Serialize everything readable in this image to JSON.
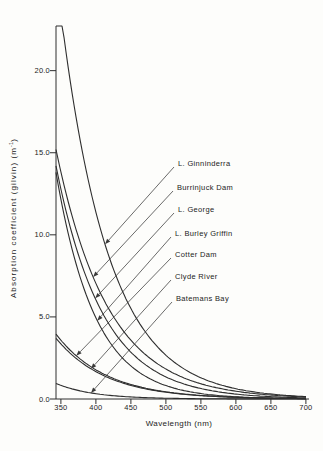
{
  "figure": {
    "x_axis_title": "Wavelength (nm)",
    "y_axis_title_prefix": "Absorption coefficient (gilvin)  (m",
    "y_axis_title_sup": "-1",
    "y_axis_title_suffix": ")"
  },
  "chart_data": {
    "type": "line",
    "title": "",
    "xlabel": "Wavelength (nm)",
    "ylabel": "Absorption coefficient (gilvin) (m^-1)",
    "grid": false,
    "legend_style": "leader-line annotations with arrowheads",
    "x_axis": {
      "min": 343,
      "max": 706,
      "ticks": [
        350,
        400,
        450,
        500,
        550,
        600,
        650,
        700
      ]
    },
    "y_axis": {
      "min": 0,
      "max": 22.72,
      "ticks": [
        0,
        5,
        10,
        15,
        20
      ],
      "tick_labels": [
        "0.0",
        "5.0",
        "10.0",
        "15.0",
        "20.0"
      ]
    },
    "x_sample_nm": [
      350,
      400,
      450,
      500,
      550,
      600,
      650,
      700
    ],
    "series": [
      {
        "name": "L. Ginninderra",
        "values": [
          23.5,
          11.4,
          5.5,
          2.7,
          1.3,
          0.62,
          0.3,
          0.15
        ],
        "model": {
          "a343": 26.0,
          "s_per_nm": 0.0145
        },
        "arrow_nm": 413,
        "clipped_at_top": true
      },
      {
        "name": "Burrinjuck Dam",
        "values": [
          13.8,
          7.0,
          3.6,
          1.8,
          0.93,
          0.47,
          0.24,
          0.12
        ],
        "model": {
          "a343": 15.2,
          "s_per_nm": 0.0135
        },
        "arrow_nm": 396,
        "clipped_at_top": false
      },
      {
        "name": "L. George",
        "values": [
          12.8,
          6.1,
          2.9,
          1.4,
          0.65,
          0.31,
          0.15,
          0.07
        ],
        "model": {
          "a343": 14.2,
          "s_per_nm": 0.015
        },
        "arrow_nm": 399,
        "clipped_at_top": false
      },
      {
        "name": "L. Burley Griffin",
        "values": [
          12.2,
          4.9,
          2.0,
          0.81,
          0.33,
          0.13,
          0.05,
          0.02
        ],
        "model": {
          "a343": 13.8,
          "s_per_nm": 0.018
        },
        "arrow_nm": 402,
        "clipped_at_top": false
      },
      {
        "name": "Cotter Dam",
        "values": [
          3.6,
          1.8,
          0.89,
          0.44,
          0.22,
          0.11,
          0.05,
          0.03
        ],
        "model": {
          "a343": 3.95,
          "s_per_nm": 0.014
        },
        "arrow_nm": 372,
        "clipped_at_top": false
      },
      {
        "name": "Clyde River",
        "values": [
          3.4,
          1.7,
          0.83,
          0.41,
          0.2,
          0.1,
          0.05,
          0.02
        ],
        "model": {
          "a343": 3.7,
          "s_per_nm": 0.014
        },
        "arrow_nm": 393,
        "clipped_at_top": false
      },
      {
        "name": "Batemans Bay",
        "values": [
          0.83,
          0.32,
          0.12,
          0.05,
          0.02,
          0.01,
          0.0,
          0.0
        ],
        "model": {
          "a343": 0.95,
          "s_per_nm": 0.019
        },
        "arrow_nm": 393,
        "clipped_at_top": false
      }
    ]
  },
  "colors": {
    "line": "#2e2e2e",
    "leader": "#3a3a3a",
    "text": "#232323",
    "background": "#fdfdfb"
  }
}
